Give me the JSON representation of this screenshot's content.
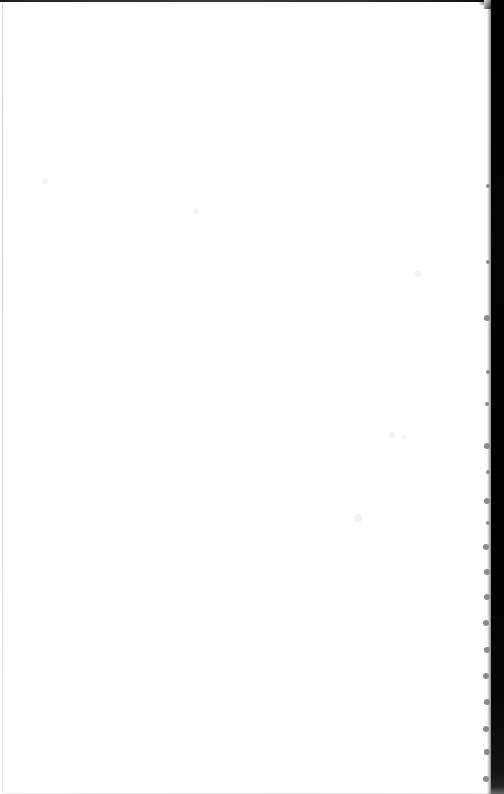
{
  "document": {
    "kind": "scanned-page",
    "page_label": "",
    "body_text": "",
    "width_px": 504,
    "height_px": 794,
    "paper_color": "#ffffff",
    "ink_color": "#1a1a1a"
  },
  "artifacts": {
    "gutter_band": {
      "name": "scanner-gutter-shadow",
      "edge": "right",
      "color": "#000000",
      "left_x": 491,
      "width_px": 13
    },
    "top_edge": {
      "name": "top-scan-line",
      "color": "#2a2a2a",
      "height_px": 2
    },
    "left_edge": {
      "name": "left-page-edge-line",
      "color": "#d2d2d2",
      "width_px": 1
    },
    "bottom_edge": {
      "name": "bottom-scan-line",
      "color": "#e3e3e3",
      "height_px": 1
    },
    "speckle_color": "#8a8a8a",
    "dust_color": "#f2f2f2",
    "speckles": [
      {
        "x": 488,
        "y": 186,
        "r": 2
      },
      {
        "x": 488,
        "y": 262,
        "r": 2
      },
      {
        "x": 487,
        "y": 318,
        "r": 3
      },
      {
        "x": 488,
        "y": 372,
        "r": 2
      },
      {
        "x": 487,
        "y": 404,
        "r": 2
      },
      {
        "x": 487,
        "y": 446,
        "r": 3
      },
      {
        "x": 488,
        "y": 472,
        "r": 2
      },
      {
        "x": 487,
        "y": 501,
        "r": 3
      },
      {
        "x": 488,
        "y": 523,
        "r": 2
      },
      {
        "x": 486,
        "y": 547,
        "r": 3
      },
      {
        "x": 487,
        "y": 572,
        "r": 3
      },
      {
        "x": 487,
        "y": 597,
        "r": 3
      },
      {
        "x": 486,
        "y": 623,
        "r": 3
      },
      {
        "x": 487,
        "y": 650,
        "r": 3
      },
      {
        "x": 486,
        "y": 676,
        "r": 3
      },
      {
        "x": 487,
        "y": 702,
        "r": 3
      },
      {
        "x": 486,
        "y": 729,
        "r": 3
      },
      {
        "x": 487,
        "y": 752,
        "r": 3
      },
      {
        "x": 486,
        "y": 779,
        "r": 3
      }
    ],
    "dust": [
      {
        "x": 45,
        "y": 181,
        "r": 3
      },
      {
        "x": 196,
        "y": 211,
        "r": 3
      },
      {
        "x": 418,
        "y": 274,
        "r": 3
      },
      {
        "x": 392,
        "y": 435,
        "r": 3
      },
      {
        "x": 404,
        "y": 437,
        "r": 2
      },
      {
        "x": 358,
        "y": 518,
        "r": 4
      }
    ]
  }
}
